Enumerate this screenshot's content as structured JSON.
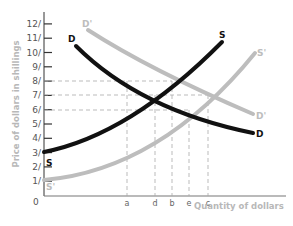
{
  "chart_data": {
    "type": "line",
    "title": "",
    "xlabel": "Quantity of dollars",
    "ylabel": "Price of dollars in shillings",
    "origin_label": "0",
    "y_ticks": [
      "1/",
      "2/",
      "3/",
      "4/",
      "5/",
      "6/",
      "7/",
      "8/",
      "9/",
      "10/",
      "11/",
      "12/"
    ],
    "ylim": [
      0,
      12.5
    ],
    "x_categories": [
      "a",
      "d",
      "b",
      "e",
      "c"
    ],
    "x_category_positions": {
      "a": 0.34,
      "d": 0.46,
      "b": 0.53,
      "e": 0.6,
      "c": 0.68
    },
    "grid": false,
    "reference_lines": [
      {
        "type": "horizontal",
        "y": 8,
        "from_x": 0,
        "to_x": "b"
      },
      {
        "type": "horizontal",
        "y": 7,
        "from_x": 0,
        "to_x": "c"
      },
      {
        "type": "horizontal",
        "y": 6,
        "from_x": 0,
        "to_x": "e"
      },
      {
        "type": "vertical",
        "x": "a",
        "from_y": 0,
        "to_y": 8
      },
      {
        "type": "vertical",
        "x": "d",
        "from_y": 0,
        "to_y": 7
      },
      {
        "type": "vertical",
        "x": "b",
        "from_y": 0,
        "to_y": 8
      },
      {
        "type": "vertical",
        "x": "e",
        "from_y": 0,
        "to_y": 6
      },
      {
        "type": "vertical",
        "x": "c",
        "from_y": 0,
        "to_y": 7
      }
    ],
    "series": [
      {
        "name": "S",
        "color": "#111111",
        "style": "supply",
        "points": [
          [
            0,
            3
          ],
          [
            0.34,
            6
          ],
          [
            0.46,
            7
          ],
          [
            0.53,
            8
          ],
          [
            0.74,
            11
          ]
        ]
      },
      {
        "name": "S'",
        "color": "#bdbdbd",
        "style": "supply",
        "points": [
          [
            0,
            1
          ],
          [
            0.34,
            3
          ],
          [
            0.6,
            6
          ],
          [
            0.68,
            7
          ],
          [
            0.87,
            10
          ]
        ]
      },
      {
        "name": "D",
        "color": "#111111",
        "style": "demand",
        "points": [
          [
            0.13,
            10.5
          ],
          [
            0.34,
            8
          ],
          [
            0.46,
            7
          ],
          [
            0.6,
            6
          ],
          [
            0.87,
            4.4
          ]
        ]
      },
      {
        "name": "D'",
        "color": "#bdbdbd",
        "style": "demand",
        "points": [
          [
            0.18,
            11.5
          ],
          [
            0.53,
            8
          ],
          [
            0.68,
            7
          ],
          [
            0.87,
            5.7
          ]
        ]
      }
    ],
    "legend": "inline labels at curve ends"
  },
  "labels": {
    "S_end": "S",
    "S_start": "S",
    "S_prime_end": "S'",
    "S_prime_start": "S'",
    "D_start": "D",
    "D_end": "D",
    "D_prime_start": "D'",
    "D_prime_end": "D'"
  }
}
